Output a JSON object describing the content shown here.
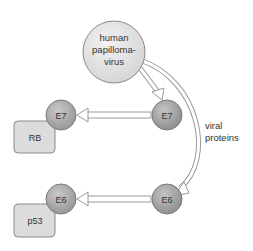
{
  "diagram": {
    "virus": {
      "label_lines": [
        "human",
        "papilloma-",
        "virus"
      ]
    },
    "viral_proteins_label": [
      "viral",
      "proteins"
    ],
    "proteins": {
      "e7_right": "E7",
      "e7_left": "E7",
      "e6_right": "E6",
      "e6_left": "E6"
    },
    "targets": {
      "rb": "RB",
      "p53": "p53"
    },
    "colors": {
      "virus_fill": "#e0e0e0",
      "protein_fill": "#a8a8a8",
      "target_fill": "#dcdcdc",
      "stroke": "#8a8a8a",
      "text": "#333333"
    }
  }
}
